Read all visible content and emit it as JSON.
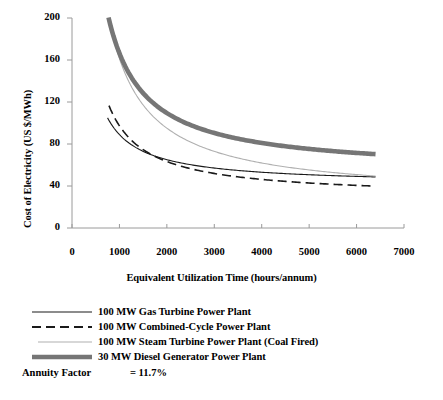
{
  "chart_data": {
    "type": "line",
    "title": "",
    "xlabel": "Equivalent Utilization Time (hours/annum)",
    "ylabel": "Cost of Electricity  (US $/MWh)",
    "xlim": [
      0,
      7000
    ],
    "ylim": [
      0,
      200
    ],
    "xticks": [
      0,
      1000,
      2000,
      3000,
      4000,
      5000,
      6000,
      7000
    ],
    "yticks": [
      0,
      40,
      80,
      120,
      160,
      200
    ],
    "xtick_labels": [
      "0",
      "1000",
      "2000",
      "3000",
      "4000",
      "5000",
      "6000",
      "7000"
    ],
    "ytick_labels": [
      "0",
      "40",
      "80",
      "120",
      "160",
      "200"
    ],
    "grid": false,
    "legend_position": "below-plot",
    "x": [
      750,
      1000,
      1250,
      1500,
      1750,
      2000,
      2250,
      2500,
      2750,
      3000,
      3250,
      3500,
      3750,
      4000,
      4250,
      4500,
      4750,
      5000,
      5250,
      5500,
      5750,
      6000,
      6250,
      6400
    ],
    "series": [
      {
        "name": "100 MW Gas Turbine Power Plant",
        "style": "solid-thin-black",
        "color": "#1a1a1a",
        "linewidth": 1.1,
        "x_start": 750,
        "x_end": 6400,
        "values": [
          105.0,
          89.0,
          79.4,
          73.0,
          68.4,
          65.0,
          62.3,
          60.2,
          58.4,
          57.0,
          55.8,
          54.7,
          53.8,
          53.0,
          52.4,
          51.8,
          51.2,
          50.8,
          50.3,
          50.0,
          49.6,
          49.3,
          49.0,
          48.9
        ]
      },
      {
        "name": "100 MW Combined-Cycle Power Plant",
        "style": "dashed-black",
        "color": "#1a1a1a",
        "linewidth": 1.6,
        "x_start": 780,
        "x_end": 6400,
        "values": [
          120.0,
          97.5,
          83.8,
          74.7,
          68.1,
          63.2,
          59.4,
          56.4,
          53.9,
          51.9,
          50.1,
          48.6,
          47.3,
          46.2,
          45.2,
          44.3,
          43.6,
          42.9,
          42.2,
          41.7,
          41.2,
          40.7,
          40.3,
          40.1
        ]
      },
      {
        "name": "100 MW Steam Turbine Power Plant (Coal Fired)",
        "style": "solid-thin-lightgray",
        "color": "#b0b0b0",
        "linewidth": 1.1,
        "x_start": 810,
        "x_end": 6400,
        "values": [
          200.0,
          165.0,
          137.4,
          119.0,
          105.9,
          96.0,
          88.3,
          82.2,
          77.2,
          73.0,
          69.5,
          66.5,
          63.9,
          61.6,
          59.6,
          57.8,
          56.2,
          54.8,
          53.5,
          52.3,
          51.2,
          50.3,
          49.4,
          48.9
        ]
      },
      {
        "name": "30 MW Diesel Generator Power Plant",
        "style": "solid-thick-gray",
        "color": "#767676",
        "linewidth": 4.6,
        "x_start": 770,
        "x_end": 6400,
        "values": [
          200.0,
          169.0,
          145.6,
          129.9,
          118.7,
          110.3,
          103.7,
          98.5,
          94.2,
          90.7,
          87.6,
          85.0,
          82.8,
          80.8,
          79.0,
          77.5,
          76.1,
          74.8,
          73.7,
          72.7,
          71.8,
          70.9,
          70.2,
          69.8
        ]
      }
    ]
  },
  "legend": {
    "items": [
      {
        "label": "100 MW Gas Turbine Power Plant",
        "style": "solid-thin-black"
      },
      {
        "label": "100 MW Combined-Cycle Power Plant",
        "style": "dashed-black"
      },
      {
        "label": "100 MW Steam Turbine Power Plant (Coal Fired)",
        "style": "solid-thin-lightgray"
      },
      {
        "label": "30 MW Diesel Generator Power Plant",
        "style": "solid-thick-gray"
      }
    ]
  },
  "annotations": {
    "annuity_label": "Annuity Factor",
    "annuity_value": "= 11.7%"
  },
  "colors": {
    "axis": "#9a9a9a",
    "text": "#000000",
    "gas_turbine": "#1a1a1a",
    "combined_cycle": "#1a1a1a",
    "steam_turbine": "#b0b0b0",
    "diesel": "#767676",
    "background": "#ffffff"
  }
}
